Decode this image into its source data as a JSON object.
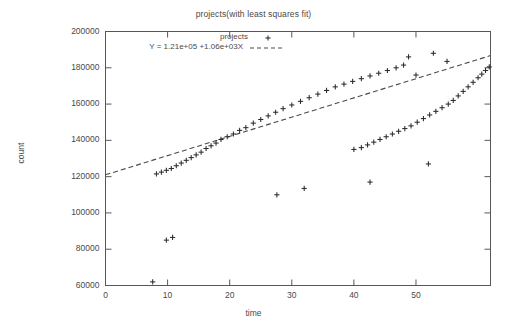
{
  "chart_data": {
    "type": "scatter",
    "title": "projects(with least squares fit)",
    "xlabel": "time",
    "ylabel": "count",
    "xlim": [
      0,
      62
    ],
    "ylim": [
      60000,
      200000
    ],
    "grid": false,
    "legend_position": "top-center-inside",
    "xticks": [
      0,
      10,
      20,
      30,
      40,
      50
    ],
    "xtick_labels": [
      "0",
      "10",
      "20",
      "30",
      "40",
      "50"
    ],
    "yticks": [
      60000,
      80000,
      100000,
      120000,
      140000,
      160000,
      180000,
      200000
    ],
    "ytick_labels": [
      "60000",
      "80000",
      "100000",
      "120000",
      "140000",
      "160000",
      "180000",
      "200000"
    ],
    "series": [
      {
        "name": "projects",
        "type": "scatter",
        "marker": "+",
        "color": "#2b2b2b",
        "points": [
          [
            7.6,
            62000
          ],
          [
            9.8,
            85000
          ],
          [
            10.8,
            86500
          ],
          [
            27.6,
            110000
          ],
          [
            32.0,
            113500
          ],
          [
            42.6,
            117000
          ],
          [
            52.0,
            127000
          ],
          [
            8.2,
            121500
          ],
          [
            9.0,
            122500
          ],
          [
            9.8,
            123500
          ],
          [
            10.6,
            124500
          ],
          [
            11.4,
            126000
          ],
          [
            12.2,
            127500
          ],
          [
            13.0,
            129000
          ],
          [
            13.8,
            130500
          ],
          [
            14.6,
            132000
          ],
          [
            15.4,
            133500
          ],
          [
            16.2,
            135500
          ],
          [
            17.0,
            137000
          ],
          [
            17.8,
            138500
          ],
          [
            18.6,
            140500
          ],
          [
            19.6,
            142000
          ],
          [
            20.6,
            143500
          ],
          [
            21.6,
            145500
          ],
          [
            22.6,
            147000
          ],
          [
            23.8,
            149500
          ],
          [
            25.0,
            151500
          ],
          [
            26.2,
            153500
          ],
          [
            27.4,
            155500
          ],
          [
            28.6,
            157500
          ],
          [
            30.0,
            159500
          ],
          [
            31.4,
            161500
          ],
          [
            32.8,
            163500
          ],
          [
            34.2,
            165500
          ],
          [
            35.6,
            167500
          ],
          [
            37.0,
            169500
          ],
          [
            38.4,
            171000
          ],
          [
            39.8,
            172500
          ],
          [
            41.2,
            174000
          ],
          [
            42.6,
            175500
          ],
          [
            44.0,
            177000
          ],
          [
            45.4,
            178500
          ],
          [
            46.8,
            180000
          ],
          [
            48.0,
            181500
          ],
          [
            48.8,
            186000
          ],
          [
            50.0,
            176000
          ],
          [
            52.8,
            188000
          ],
          [
            55.0,
            183500
          ],
          [
            40.0,
            135000
          ],
          [
            41.2,
            136000
          ],
          [
            42.2,
            137500
          ],
          [
            43.2,
            139000
          ],
          [
            44.2,
            140500
          ],
          [
            45.2,
            142000
          ],
          [
            46.2,
            143500
          ],
          [
            47.2,
            145000
          ],
          [
            48.2,
            146500
          ],
          [
            49.2,
            148000
          ],
          [
            50.2,
            150000
          ],
          [
            51.2,
            152000
          ],
          [
            52.2,
            154000
          ],
          [
            53.2,
            156000
          ],
          [
            54.2,
            158000
          ],
          [
            55.2,
            160000
          ],
          [
            56.0,
            162000
          ],
          [
            56.8,
            164500
          ],
          [
            57.6,
            167000
          ],
          [
            58.4,
            169500
          ],
          [
            59.2,
            172000
          ],
          [
            60.0,
            174500
          ],
          [
            60.6,
            176500
          ],
          [
            61.2,
            178500
          ],
          [
            61.8,
            180500
          ]
        ]
      },
      {
        "name": "Y = 1.21e+05 +1.06e+03X",
        "type": "line",
        "style": "dashed",
        "color": "#4a4a4a",
        "intercept": 121000,
        "slope": 1060,
        "x_start": 0,
        "x_end": 62
      }
    ],
    "legend_entries": [
      {
        "label": "projects",
        "marker": "+"
      },
      {
        "label": "Y = 1.21e+05 +1.06e+03X",
        "marker": "dashed-line"
      }
    ]
  },
  "legend": {
    "series_label": "projects",
    "fit_label": "Y = 1.21e+05 +1.06e+03X"
  }
}
